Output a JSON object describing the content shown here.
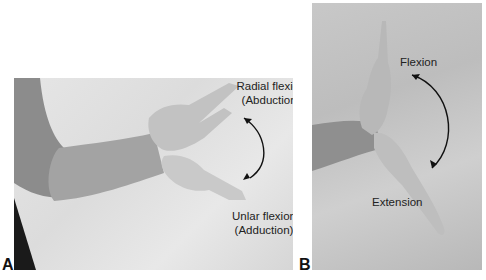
{
  "figure": {
    "panels": [
      {
        "id": "A",
        "label": "A",
        "description": "Arm extended horizontally with hand shown in radial and ulnar deviation",
        "annotations": {
          "top_line1": "Radial flexion",
          "top_line2": "(Abduction)",
          "bottom_line1": "Unlar flexion",
          "bottom_line2": "(Adduction)"
        },
        "arrow": "double-headed curved arrow"
      },
      {
        "id": "B",
        "label": "B",
        "description": "Forearm with hand shown in wrist flexion and extension",
        "annotations": {
          "top": "Flexion",
          "bottom": "Extension"
        },
        "arrow": "double-headed curved arrow"
      }
    ]
  }
}
